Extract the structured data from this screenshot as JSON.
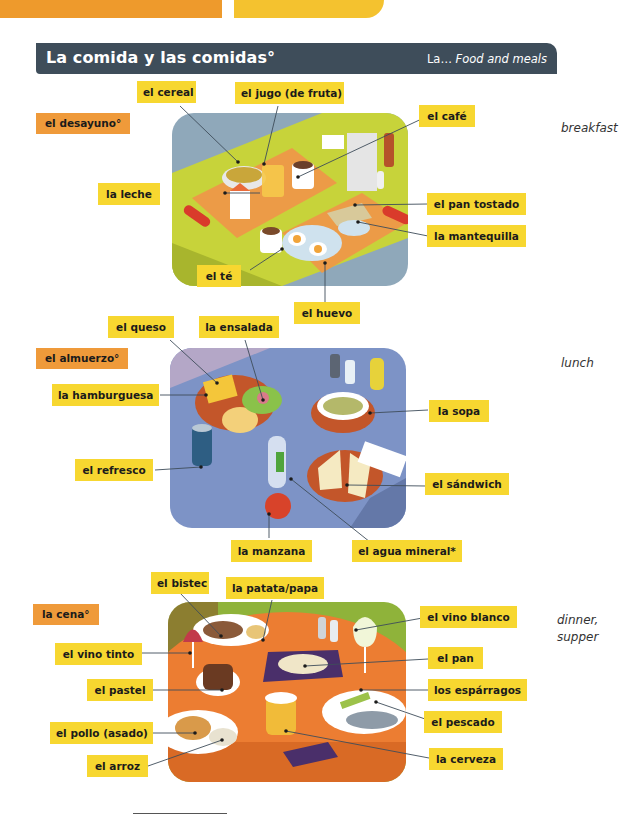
{
  "header": {
    "title": "La comida y las comidas°",
    "subtitle_prefix": "La…",
    "subtitle_english": "Food and meals"
  },
  "colors": {
    "header_bar": "#3e4d5a",
    "label_yellow": "#f7d730",
    "meal_orange": "#ef9a3a",
    "tab_orange": "#ee9a2c",
    "tab_yellow": "#f4c22f"
  },
  "sections": [
    {
      "meal": "el desayuno°",
      "gloss": "breakfast",
      "labels": [
        "el cereal",
        "el jugo (de fruta)",
        "el café",
        "la leche",
        "el pan tostado",
        "la mantequilla",
        "el té",
        "el huevo"
      ]
    },
    {
      "meal": "el almuerzo°",
      "gloss": "lunch",
      "labels": [
        "el queso",
        "la ensalada",
        "la hamburguesa",
        "la sopa",
        "el refresco",
        "el sándwich",
        "la manzana",
        "el agua mineral*"
      ]
    },
    {
      "meal": "la cena°",
      "gloss_line1": "dinner,",
      "gloss_line2": "supper",
      "labels": [
        "el bistec",
        "la patata/papa",
        "el vino blanco",
        "el vino tinto",
        "el pan",
        "el pastel",
        "los espárragos",
        "el pescado",
        "el pollo (asado)",
        "la cerveza",
        "el arroz"
      ]
    }
  ]
}
